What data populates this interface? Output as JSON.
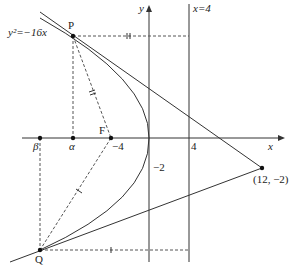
{
  "diagram": {
    "curve_label": "y²=−16x",
    "axes": {
      "x_label": "x",
      "y_label": "y"
    },
    "directrix_label": "x=4",
    "points": {
      "P": "P",
      "Q": "Q",
      "F": "F",
      "alpha": "α",
      "beta": "β",
      "external_point": "(12, −2)"
    },
    "tick_labels": {
      "focus_x": "−4",
      "directrix_x": "4",
      "y_minus2": "−2"
    },
    "colors": {
      "stroke": "#333333",
      "background": "#ffffff"
    }
  }
}
